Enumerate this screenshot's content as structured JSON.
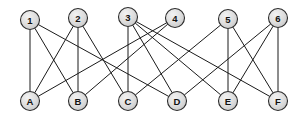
{
  "diagram": {
    "canvas": {
      "width": 307,
      "height": 120,
      "background": "#ffffff"
    },
    "style": {
      "node_fill": "#d9d9d9",
      "node_fill_highlight": "#f0f0f0",
      "node_stroke": "#2b2b2b",
      "edge_color": "#1a1a1a",
      "label_color": "#111111",
      "node_radius": 9.5,
      "edge_width": 1
    },
    "top_nodes": [
      {
        "id": "1",
        "label": "1",
        "x": 30,
        "y": 20
      },
      {
        "id": "2",
        "label": "2",
        "x": 78,
        "y": 18
      },
      {
        "id": "3",
        "label": "3",
        "x": 128,
        "y": 17
      },
      {
        "id": "4",
        "label": "4",
        "x": 175,
        "y": 18
      },
      {
        "id": "5",
        "label": "5",
        "x": 228,
        "y": 19
      },
      {
        "id": "6",
        "label": "6",
        "x": 278,
        "y": 18
      }
    ],
    "bottom_nodes": [
      {
        "id": "A",
        "label": "A",
        "x": 30,
        "y": 101
      },
      {
        "id": "B",
        "label": "B",
        "x": 78,
        "y": 101
      },
      {
        "id": "C",
        "label": "C",
        "x": 128,
        "y": 101
      },
      {
        "id": "D",
        "label": "D",
        "x": 177,
        "y": 101
      },
      {
        "id": "E",
        "label": "E",
        "x": 228,
        "y": 101
      },
      {
        "id": "F",
        "label": "F",
        "x": 278,
        "y": 101
      }
    ],
    "edges": [
      {
        "from": "1",
        "to": "A"
      },
      {
        "from": "1",
        "to": "B"
      },
      {
        "from": "1",
        "to": "D"
      },
      {
        "from": "2",
        "to": "A"
      },
      {
        "from": "2",
        "to": "B"
      },
      {
        "from": "2",
        "to": "C"
      },
      {
        "from": "3",
        "to": "C"
      },
      {
        "from": "3",
        "to": "D"
      },
      {
        "from": "3",
        "to": "E"
      },
      {
        "from": "3",
        "to": "F"
      },
      {
        "from": "4",
        "to": "A"
      },
      {
        "from": "4",
        "to": "B"
      },
      {
        "from": "5",
        "to": "C"
      },
      {
        "from": "5",
        "to": "E"
      },
      {
        "from": "5",
        "to": "F"
      },
      {
        "from": "6",
        "to": "D"
      },
      {
        "from": "6",
        "to": "E"
      },
      {
        "from": "6",
        "to": "F"
      }
    ],
    "counts": {
      "top": 6,
      "bottom": 6,
      "edges": 18
    }
  }
}
